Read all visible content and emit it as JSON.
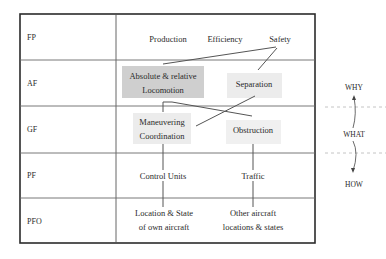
{
  "diagram": {
    "type": "abstraction-hierarchy",
    "rows": [
      {
        "key": "FP",
        "label": "FP"
      },
      {
        "key": "AF",
        "label": "AF"
      },
      {
        "key": "GF",
        "label": "GF"
      },
      {
        "key": "PF",
        "label": "PF"
      },
      {
        "key": "PFO",
        "label": "PFO"
      }
    ],
    "nodes": {
      "production": "Production",
      "efficiency": "Efficiency",
      "safety": "Safety",
      "locomotion_line1": "Absolute & relative",
      "locomotion_line2": "Locomotion",
      "separation": "Separation",
      "maneuvering_line1": "Maneuvering",
      "maneuvering_line2": "Coordination",
      "obstruction": "Obstruction",
      "control_units": "Control Units",
      "traffic": "Traffic",
      "own_line1": "Location & State",
      "own_line2": "of own aircraft",
      "other_line1": "Other aircraft",
      "other_line2": "locations & states"
    },
    "side_axis": {
      "top": "WHY",
      "middle": "WHAT",
      "bottom": "HOW"
    },
    "colors": {
      "border": "#2b2b2b",
      "grid": "#6a6a6a",
      "box_dark": "#cfcfcf",
      "box_light": "#ececec",
      "link": "#555555",
      "dashed": "#bdbdbd"
    }
  }
}
